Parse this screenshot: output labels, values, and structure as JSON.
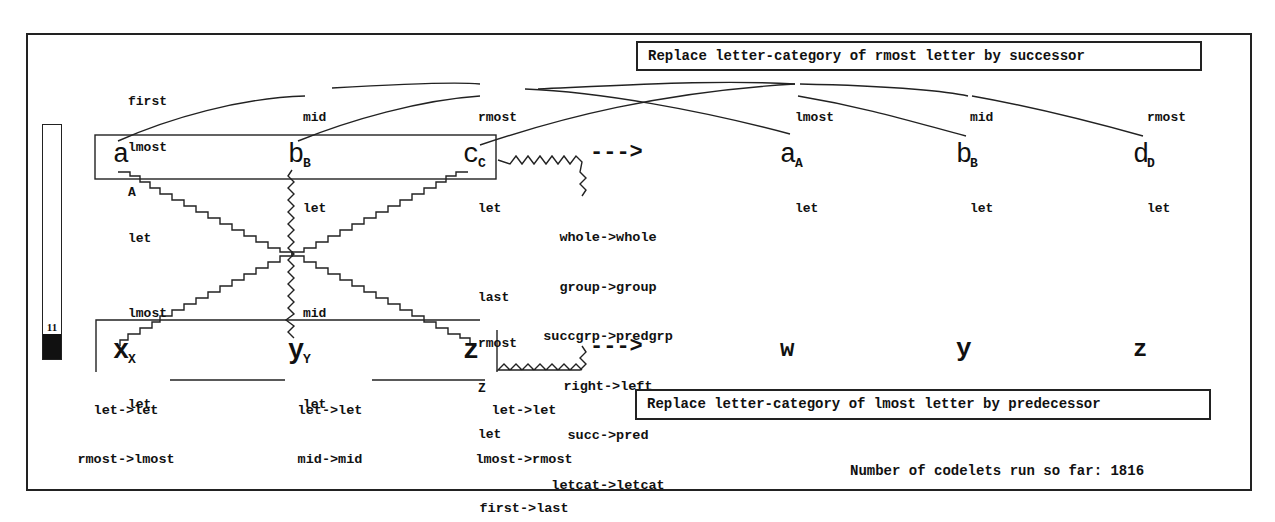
{
  "initial_string": {
    "letters": [
      "a",
      "b",
      "c"
    ],
    "descriptions": [
      [
        "first",
        "lmost",
        "A",
        "let"
      ],
      [
        "mid",
        "B",
        "let"
      ],
      [
        "rmost",
        "C",
        "let"
      ]
    ]
  },
  "modified_string": {
    "letters": [
      "a",
      "b",
      "d"
    ],
    "descriptions": [
      [
        "lmost",
        "A",
        "let"
      ],
      [
        "mid",
        "B",
        "let"
      ],
      [
        "rmost",
        "D",
        "let"
      ]
    ]
  },
  "target_string": {
    "letters": [
      "x",
      "y",
      "z"
    ],
    "descriptions": [
      [
        "lmost",
        "X",
        "let"
      ],
      [
        "mid",
        "Y",
        "let"
      ],
      [
        "last",
        "rmost",
        "Z",
        "let"
      ]
    ]
  },
  "answer_string": {
    "letters": [
      "w",
      "y",
      "z"
    ]
  },
  "arrow_label": "--->",
  "group_mapping": [
    "whole->whole",
    "group->group",
    "succgrp->predgrp",
    "right->left",
    "succ->pred",
    "letcat->letcat"
  ],
  "bond_mappings": [
    [
      "let->let",
      "rmost->lmost"
    ],
    [
      "let->let",
      "mid->mid"
    ],
    [
      "let->let",
      "lmost->rmost",
      "first->last"
    ]
  ],
  "rules": {
    "initial": "Replace letter-category of rmost letter by successor",
    "translated": "Replace letter-category of lmost letter by predecessor"
  },
  "temperature": {
    "value": "11"
  },
  "status": {
    "codelets_label": "Number of codelets run so far: 1816"
  }
}
